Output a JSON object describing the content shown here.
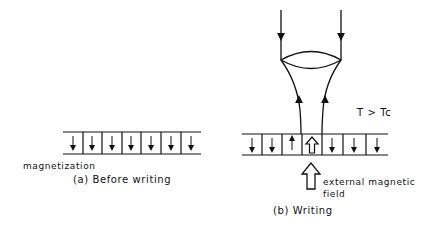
{
  "left_panel": {
    "caption": "(a) Before writing",
    "label_magnetization": "magnetization",
    "cells": 7,
    "cell_directions": [
      "down",
      "down",
      "down",
      "down",
      "down",
      "down",
      "down"
    ]
  },
  "right_panel": {
    "caption": "(b) Writing",
    "temperature_condition": "T > Tc",
    "field_label_line1": "external magnetic",
    "field_label_line2": "field",
    "cells": 7,
    "cell_directions": [
      "down",
      "down",
      "down",
      "up-hollow",
      "down",
      "down",
      "down"
    ]
  },
  "colors": {
    "ink": "#111111",
    "background": "#ffffff"
  }
}
